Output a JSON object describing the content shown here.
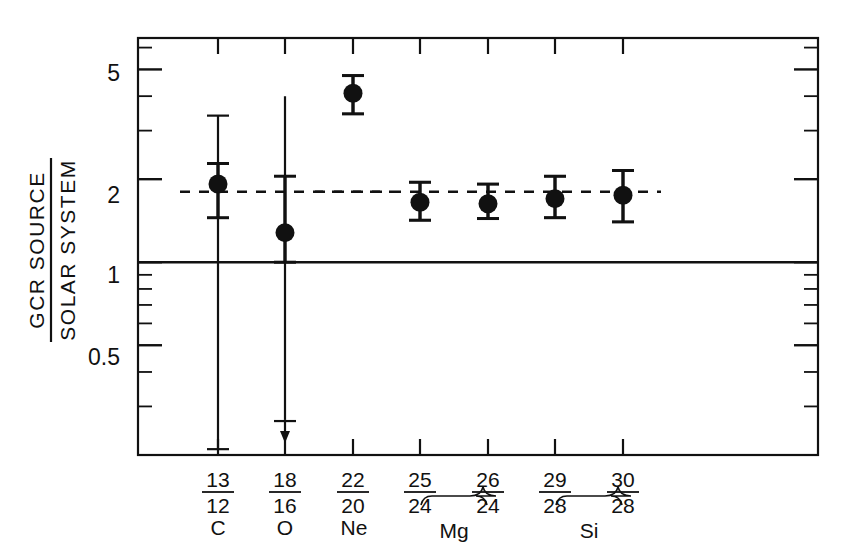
{
  "figure": {
    "ylabel_numerator": "GCR SOURCE",
    "ylabel_denominator": "SOLAR SYSTEM",
    "background_color": "#ffffff",
    "ink_color": "#111111"
  },
  "axis": {
    "y_tick_labels": [
      "5",
      "2",
      "1",
      "0.5"
    ],
    "y_tick_values": [
      5,
      2,
      1,
      0.5
    ],
    "y_label_5": "5",
    "y_label_2": "2",
    "y_label_1": "1",
    "y_label_05": "0.5"
  },
  "xlabels": {
    "ratios_top": [
      "13",
      "18",
      "22",
      "25",
      "26",
      "29",
      "30"
    ],
    "ratios_bottom": [
      "12",
      "16",
      "20",
      "24",
      "24",
      "28",
      "28"
    ],
    "r0_num": "13",
    "r0_den": "12",
    "r1_num": "18",
    "r1_den": "16",
    "r2_num": "22",
    "r2_den": "20",
    "r3_num": "25",
    "r3_den": "24",
    "r4_num": "26",
    "r4_den": "24",
    "r5_num": "29",
    "r5_den": "28",
    "r6_num": "30",
    "r6_den": "28",
    "element_C": "C",
    "element_O": "O",
    "element_Ne": "Ne",
    "element_Mg": "Mg",
    "element_Si": "Si"
  },
  "chart_data": {
    "type": "scatter",
    "title": "",
    "subtitle": "",
    "xlabel": "",
    "ylabel": "GCR SOURCE / SOLAR SYSTEM",
    "yscale": "log",
    "ylim": [
      0.2,
      6.5
    ],
    "grid": false,
    "legend": "none",
    "y_major_ticks": [
      0.5,
      1,
      2,
      5
    ],
    "y_tick_labels": [
      "0.5",
      "1",
      "2",
      "5"
    ],
    "reference_lines": [
      {
        "name": "unity-line",
        "y": 1.0,
        "style": "solid",
        "span": "full"
      },
      {
        "name": "mean-enhancement-line-left",
        "y": 1.8,
        "style": "dashed",
        "x_from_index": 0,
        "x_to_index": 2
      },
      {
        "name": "mean-enhancement-line-right",
        "y": 1.8,
        "style": "dashed",
        "x_from_index": 2,
        "x_to_index": 6
      }
    ],
    "categories": [
      "13/12",
      "18/16",
      "22/20",
      "25/24",
      "26/24",
      "29/28",
      "30/28"
    ],
    "elements": [
      "C",
      "O",
      "Ne",
      "Mg",
      "Mg",
      "Si",
      "Si"
    ],
    "values": [
      1.92,
      1.28,
      4.1,
      1.65,
      1.63,
      1.7,
      1.75
    ],
    "error_inner_low": [
      1.45,
      1.0,
      3.45,
      1.42,
      1.44,
      1.45,
      1.4
    ],
    "error_inner_high": [
      2.28,
      2.05,
      4.75,
      1.95,
      1.92,
      2.05,
      2.15
    ],
    "error_outer_low": [
      0.21,
      0.27,
      3.45,
      1.42,
      1.44,
      1.45,
      1.4
    ],
    "error_outer_high": [
      3.4,
      4.0,
      4.75,
      1.95,
      1.92,
      2.05,
      2.15
    ],
    "has_upper_limit_arrow": [
      false,
      true,
      false,
      false,
      false,
      false,
      false
    ],
    "marker": "filled-circle",
    "marker_color": "#111111"
  }
}
